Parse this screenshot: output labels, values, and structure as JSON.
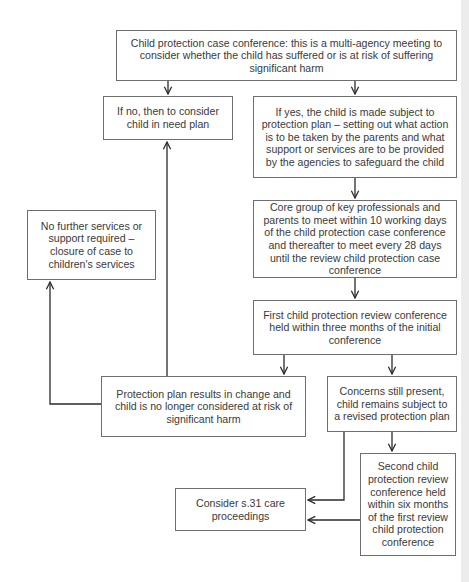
{
  "diagram": {
    "type": "flowchart",
    "colors": {
      "line": "#2a2a2a",
      "border": "#6e6e6e",
      "text": "#3a3a3a"
    },
    "nodes": {
      "conference": "Child protection case conference: this is a multi-agency meeting to consider whether the child has suffered or is at risk of suffering significant harm",
      "if_no": "If no, then to consider child in need plan",
      "if_yes": "If yes, the child is made subject to protection plan – setting out what action is to be taken by the parents and what support or services are to be provided by the agencies to safeguard the child",
      "no_further": "No further services or support required – closure of case to children's services",
      "core_group": "Core group of key professionals and parents to meet within 10 working days of the child protection case conference and thereafter to meet every 28 days until the review child protection case conference",
      "first_review": "First child protection review conference held within three months of the initial conference",
      "plan_results": "Protection plan results in change and child is no longer considered at risk of significant harm",
      "concerns": "Concerns still present, child remains subject to a revised protection plan",
      "second_review": "Second child protection review conference held within six months of the first review child protection conference",
      "s31": "Consider s.31 care proceedings"
    },
    "edges": [
      [
        "conference",
        "if_no"
      ],
      [
        "conference",
        "if_yes"
      ],
      [
        "if_yes",
        "core_group"
      ],
      [
        "core_group",
        "first_review"
      ],
      [
        "first_review",
        "plan_results"
      ],
      [
        "first_review",
        "concerns"
      ],
      [
        "plan_results",
        "no_further"
      ],
      [
        "plan_results",
        "if_no"
      ],
      [
        "concerns",
        "second_review"
      ],
      [
        "concerns",
        "s31"
      ],
      [
        "second_review",
        "s31"
      ]
    ]
  }
}
